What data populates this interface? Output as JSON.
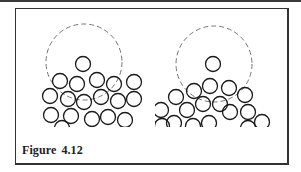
{
  "figure": {
    "caption_label": "Figure",
    "caption_number": "4.12"
  },
  "panels": [
    {
      "name": "left",
      "dashed_circle": {
        "cx": 84,
        "cy": 62,
        "r": 38
      },
      "falling_particle": {
        "cx": 83,
        "cy": 64,
        "r": 7.5
      },
      "bed_particles": [
        [
          60,
          81
        ],
        [
          77,
          84
        ],
        [
          97,
          80
        ],
        [
          114,
          84
        ],
        [
          134,
          82
        ],
        [
          50,
          96
        ],
        [
          68,
          99
        ],
        [
          84,
          102
        ],
        [
          101,
          97
        ],
        [
          118,
          101
        ],
        [
          134,
          99
        ],
        [
          51,
          115
        ],
        [
          71,
          116
        ],
        [
          92,
          119
        ],
        [
          108,
          117
        ],
        [
          125,
          120
        ],
        [
          62,
          128
        ]
      ]
    },
    {
      "name": "right",
      "dashed_circle": {
        "cx": 214,
        "cy": 64,
        "r": 38
      },
      "falling_particle": {
        "cx": 213,
        "cy": 64,
        "r": 7.5
      },
      "bed_particles": [
        [
          210,
          86
        ],
        [
          229,
          88
        ],
        [
          194,
          91
        ],
        [
          245,
          95
        ],
        [
          176,
          97
        ],
        [
          203,
          104
        ],
        [
          220,
          104
        ],
        [
          161,
          110
        ],
        [
          187,
          110
        ],
        [
          230,
          112
        ],
        [
          248,
          112
        ],
        [
          174,
          123
        ],
        [
          209,
          123
        ],
        [
          262,
          122
        ],
        [
          162,
          126
        ],
        [
          193,
          126
        ],
        [
          248,
          128
        ]
      ]
    }
  ]
}
